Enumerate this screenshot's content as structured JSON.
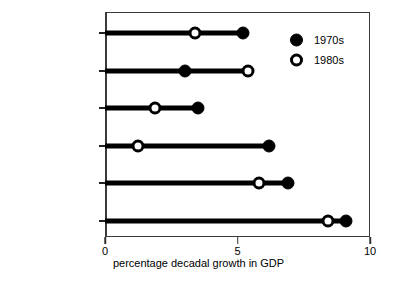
{
  "chart_data": {
    "type": "scatter",
    "subtype": "dumbbell",
    "title": "",
    "xlabel": "percentage decadal growth in GDP",
    "ylabel": "",
    "xlim": [
      0,
      10
    ],
    "xticks": [
      0,
      5,
      10
    ],
    "xtick_labels": [
      "0",
      "5",
      "10"
    ],
    "grid": false,
    "legend_position": "top-right-inside",
    "categories": [
      "Middle East",
      "South Asia",
      "Sub-Saharan Africa",
      "Latin America",
      "Southeast Asia",
      "East Asia"
    ],
    "series": [
      {
        "name": "1970s",
        "marker": "filled-circle",
        "color": "#000000",
        "values": [
          5.2,
          3.0,
          3.5,
          6.2,
          6.9,
          9.1
        ]
      },
      {
        "name": "1980s",
        "marker": "open-circle",
        "color": "#000000",
        "values": [
          3.4,
          5.4,
          1.9,
          1.25,
          5.8,
          8.4
        ]
      }
    ],
    "points": [
      {
        "category": "Middle East",
        "v1970s": 5.2,
        "v1980s": 3.4
      },
      {
        "category": "South Asia",
        "v1970s": 3.0,
        "v1980s": 5.4
      },
      {
        "category": "Sub-Saharan Africa",
        "v1970s": 3.5,
        "v1980s": 1.9
      },
      {
        "category": "Latin America",
        "v1970s": 6.2,
        "v1980s": 1.25
      },
      {
        "category": "Southeast Asia",
        "v1970s": 6.9,
        "v1980s": 5.8
      },
      {
        "category": "East Asia",
        "v1970s": 9.1,
        "v1980s": 8.4
      }
    ]
  },
  "legend": {
    "items": [
      {
        "label": "1970s",
        "marker": "filled-circle"
      },
      {
        "label": "1980s",
        "marker": "open-circle"
      }
    ]
  },
  "axis": {
    "x_title": "percentage decadal growth in GDP",
    "x_tick_labels": [
      "0",
      "5",
      "10"
    ]
  },
  "colors": {
    "ink": "#000000",
    "frame": "#3a3a3a",
    "background": "#ffffff"
  }
}
